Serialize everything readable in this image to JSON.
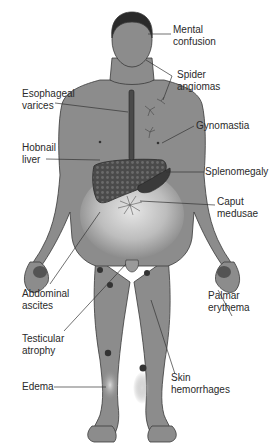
{
  "figure": {
    "colors": {
      "skin": "#8c8c8c",
      "outline": "#3a3a3a",
      "liver": "#555555",
      "spleen": "#404040",
      "edema_highlight": "#d6d6d6",
      "label_text": "#2a2a2a",
      "background": "#ffffff"
    },
    "labels": [
      {
        "id": "mental-confusion",
        "text": "Mental\nconfusion"
      },
      {
        "id": "spider-angiomas",
        "text": "Spider\nangiomas"
      },
      {
        "id": "esophageal-varices",
        "text": "Esophageal\nvarices"
      },
      {
        "id": "gynomastia",
        "text": "Gynomastia"
      },
      {
        "id": "hobnail-liver",
        "text": "Hobnail\nliver"
      },
      {
        "id": "splenomegaly",
        "text": "Splenomegaly"
      },
      {
        "id": "caput-medusae",
        "text": "Caput\nmedusae"
      },
      {
        "id": "abdominal-ascites",
        "text": "Abdominal\nascites"
      },
      {
        "id": "palmar-erythema",
        "text": "Palmar\nerythema"
      },
      {
        "id": "testicular-atrophy",
        "text": "Testicular\natrophy"
      },
      {
        "id": "skin-hemorrhages",
        "text": "Skin\nhemorrhages"
      },
      {
        "id": "edema",
        "text": "Edema"
      }
    ]
  }
}
